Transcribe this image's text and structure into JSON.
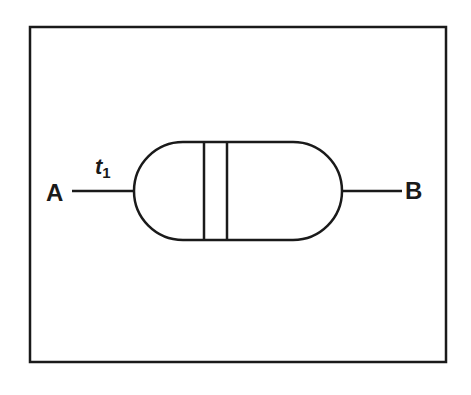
{
  "diagram": {
    "labels": {
      "left_terminal": "A",
      "right_terminal": "B",
      "time_label_main": "t",
      "time_label_sub": "1"
    },
    "colors": {
      "stroke": "#1a1a1a",
      "background": "#ffffff"
    },
    "component": "capsule with two vertical partition lines between terminals A and B"
  }
}
